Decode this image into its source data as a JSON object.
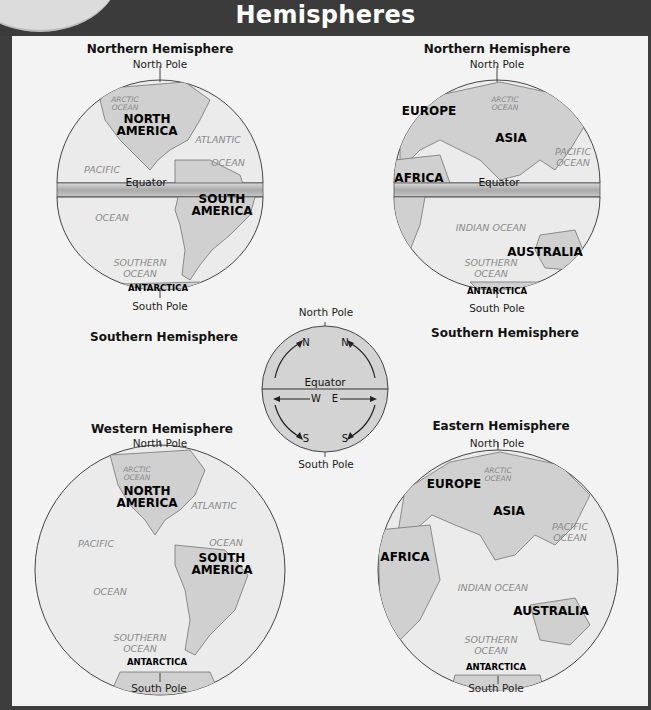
{
  "header": {
    "title": "Hemispheres"
  },
  "colors": {
    "frame": "#3d3d3d",
    "panel": "#f3f3f3",
    "ocean": "#e6e6e6",
    "land": "#cfcfcf",
    "band": "#bdbdbd"
  },
  "globes": {
    "americas_split": {
      "top_title": "Northern Hemisphere",
      "north_pole": "North Pole",
      "equator": "Equator",
      "south_pole": "South Pole",
      "bottom_title": "Southern Hemisphere",
      "labels": {
        "arctic": "ARCTIC\nOCEAN",
        "north_america_1": "NORTH",
        "north_america_2": "AMERICA",
        "atlantic": "ATLANTIC",
        "ocean1": "OCEAN",
        "pacific": "PACIFIC",
        "south_america_1": "SOUTH",
        "south_america_2": "AMERICA",
        "ocean2": "OCEAN",
        "southern_1": "SOUTHERN",
        "southern_2": "OCEAN",
        "antarctica": "ANTARCTICA"
      }
    },
    "eastern_split": {
      "top_title": "Northern Hemisphere",
      "north_pole": "North Pole",
      "equator": "Equator",
      "south_pole": "South Pole",
      "bottom_title": "Southern Hemisphere",
      "labels": {
        "arctic_1": "ARCTIC",
        "arctic_2": "OCEAN",
        "europe": "EUROPE",
        "asia": "ASIA",
        "pacific_1": "PACIFIC",
        "pacific_2": "OCEAN",
        "africa": "AFRICA",
        "indian": "INDIAN OCEAN",
        "australia": "AUSTRALIA",
        "southern_1": "SOUTHERN",
        "southern_2": "OCEAN",
        "antarctica": "ANTARCTICA"
      }
    },
    "western": {
      "title": "Western Hemisphere",
      "north_pole": "North Pole",
      "south_pole": "South Pole",
      "labels": {
        "arctic_1": "ARCTIC",
        "arctic_2": "OCEAN",
        "north_america_1": "NORTH",
        "north_america_2": "AMERICA",
        "atlantic": "ATLANTIC",
        "ocean1": "OCEAN",
        "pacific": "PACIFIC",
        "south_america_1": "SOUTH",
        "south_america_2": "AMERICA",
        "ocean2": "OCEAN",
        "southern_1": "SOUTHERN",
        "southern_2": "OCEAN",
        "antarctica": "ANTARCTICA"
      }
    },
    "eastern": {
      "title": "Eastern Hemisphere",
      "north_pole": "North Pole",
      "south_pole": "South Pole",
      "labels": {
        "arctic_1": "ARCTIC",
        "arctic_2": "OCEAN",
        "europe": "EUROPE",
        "asia": "ASIA",
        "pacific_1": "PACIFIC",
        "pacific_2": "OCEAN",
        "africa": "AFRICA",
        "indian": "INDIAN OCEAN",
        "australia": "AUSTRALIA",
        "southern_1": "SOUTHERN",
        "southern_2": "OCEAN",
        "antarctica": "ANTARCTICA"
      }
    }
  },
  "direction_diagram": {
    "north_pole": "North Pole",
    "south_pole": "South Pole",
    "equator": "Equator",
    "n_left": "N",
    "n_right": "N",
    "w": "W",
    "e": "E",
    "s_left": "S",
    "s_right": "S"
  }
}
